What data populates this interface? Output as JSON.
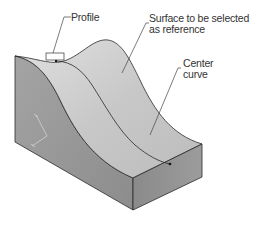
{
  "diagram": {
    "labels": {
      "profile": "Profile",
      "surface_line1": "Surface to be selected",
      "surface_line2": "as reference",
      "center_line1": "Center",
      "center_line2": "curve"
    },
    "colors": {
      "left_face": "#9a9a9a",
      "front_face": "#8e8e8e",
      "top_surface_light": "#d4d4d4",
      "top_surface_shade": "#bdbdbd",
      "edge": "#2a2a2a",
      "leader": "#444444"
    }
  }
}
